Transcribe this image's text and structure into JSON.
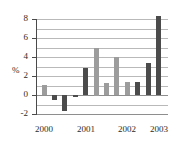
{
  "chart_data": {
    "type": "bar",
    "title": "",
    "xlabel": "",
    "ylabel": "%",
    "ylim": [
      -2,
      8
    ],
    "yticks": [
      -2,
      0,
      2,
      4,
      6,
      8
    ],
    "ytick_labels": [
      "-2",
      "0",
      "2",
      "4",
      "6",
      "8"
    ],
    "grid": true,
    "grid_interval": 1,
    "legend": "none",
    "categories": [
      "2000",
      "2001",
      "2002",
      "2003"
    ],
    "category_positions": [
      0,
      4,
      8,
      11
    ],
    "bars": [
      {
        "index": 0,
        "value": 1.1,
        "color_group": "light"
      },
      {
        "index": 1,
        "value": -0.5,
        "color_group": "dark"
      },
      {
        "index": 2,
        "value": -1.7,
        "color_group": "dark"
      },
      {
        "index": 3,
        "value": -0.2,
        "color_group": "dark"
      },
      {
        "index": 4,
        "value": 2.8,
        "color_group": "dark"
      },
      {
        "index": 5,
        "value": 5.0,
        "color_group": "light"
      },
      {
        "index": 6,
        "value": 1.25,
        "color_group": "light"
      },
      {
        "index": 7,
        "value": 4.0,
        "color_group": "light"
      },
      {
        "index": 8,
        "value": 1.4,
        "color_group": "light"
      },
      {
        "index": 9,
        "value": 1.4,
        "color_group": "dark"
      },
      {
        "index": 10,
        "value": 3.35,
        "color_group": "dark"
      },
      {
        "index": 11,
        "value": 8.3,
        "color_group": "dark"
      }
    ],
    "colors": {
      "light_bar": "#9c9c9c",
      "dark_bar": "#4b4b4b",
      "gridline": "#b9b9b9",
      "axis": "#4a4a4a",
      "text": "#2b2b2b",
      "background": "#ffffff"
    }
  }
}
